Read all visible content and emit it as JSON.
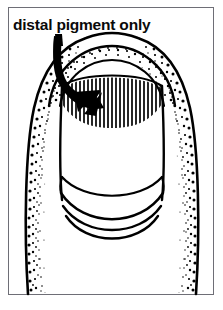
{
  "figure": {
    "domain": "Diagram",
    "caption": "distal pigment only",
    "frame": {
      "border_color": "#6e6e76",
      "background_color": "#ffffff"
    },
    "ink_color": "#000000",
    "annotation": {
      "arrow_name": "curved-pointer-arrow",
      "arrow_target": "hatched pigment band",
      "arrow_color": "#000000"
    },
    "parts": [
      {
        "name": "finger-outline",
        "label": "finger",
        "shading": "stipple"
      },
      {
        "name": "proximal-nail-fold",
        "label": "proximal nail fold / cuticle",
        "shading": "stipple"
      },
      {
        "name": "nail-plate",
        "label": "nail plate",
        "shading": "none"
      },
      {
        "name": "pigment-band",
        "label": "distal pigment band",
        "shading": "vertical-hatch"
      },
      {
        "name": "free-edge",
        "label": "distal free edge",
        "shading": "none"
      }
    ],
    "hatch": {
      "line_count": 27,
      "orientation": "vertical",
      "color": "#000000"
    },
    "stipple": {
      "dot_color": "#000000",
      "density": "dense-at-edge-fading-inward"
    }
  }
}
